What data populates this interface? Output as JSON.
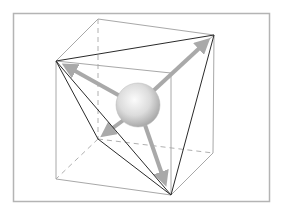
{
  "diagram": {
    "title": "",
    "colors": {
      "background": "#ffffff",
      "frame": "#b4b4b4",
      "cube_edge": "#a8a8a8",
      "cube_hidden_edge": "#b0b0b0",
      "tetra_edge": "#2a2a2a",
      "arrow": "#a9a9a9",
      "sphere_light": "#fafafa",
      "sphere_mid": "#d6d6d6",
      "sphere_dark": "#a0a0a0"
    },
    "frame": {
      "x": 13,
      "y": 13,
      "width": 257,
      "height": 189
    },
    "cube_vertices": {
      "back_top_left": [
        98,
        19
      ],
      "back_top_right": [
        214,
        35
      ],
      "front_top_left": [
        56,
        61
      ],
      "front_top_right": [
        171,
        73
      ],
      "back_bottom_left": [
        98,
        139
      ],
      "back_bottom_right": [
        213,
        153
      ],
      "front_bottom_left": [
        56,
        179
      ],
      "front_bottom_right": [
        171,
        195
      ]
    },
    "tetrahedron_vertices": [
      "back_top_right",
      "front_top_left",
      "back_bottom_left",
      "front_bottom_right"
    ],
    "sphere": {
      "cx": 138,
      "cy": 105,
      "r": 22
    },
    "arrows": [
      {
        "name": "arrow-to-top-right",
        "to": [
          212,
          37
        ]
      },
      {
        "name": "arrow-to-left",
        "to": [
          60,
          63
        ]
      },
      {
        "name": "arrow-to-back-bottom",
        "to": [
          101,
          137
        ]
      },
      {
        "name": "arrow-to-bottom",
        "to": [
          168,
          188
        ]
      }
    ]
  }
}
